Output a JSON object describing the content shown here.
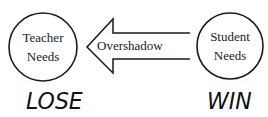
{
  "diagram": {
    "nodes": [
      {
        "id": "teacher",
        "line1": "Teacher",
        "line2": "Needs"
      },
      {
        "id": "student",
        "line1": "Student",
        "line2": "Needs"
      }
    ],
    "arrow": {
      "label": "Overshadow",
      "direction": "right-to-left",
      "from": "student",
      "to": "teacher"
    },
    "outcomes": {
      "teacher": "LOSE",
      "student": "WIN"
    },
    "colors": {
      "stroke": "#1a1a1a",
      "text": "#1a1a1a",
      "background": "#ffffff"
    }
  }
}
